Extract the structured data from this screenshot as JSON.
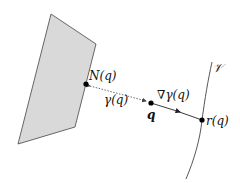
{
  "diagram": {
    "colors": {
      "polygon_fill": "#d9d9d9",
      "stroke": "#444444",
      "point": "#000000",
      "background": "#ffffff"
    },
    "labels": {
      "manifold": "𝒱",
      "projection_point": "N(q)",
      "distance": "γ(q)",
      "query_point": "q",
      "gradient": "∇γ(q)",
      "reflected_point": "r(q)"
    },
    "points": {
      "N_q": [
        86,
        84
      ],
      "q": [
        151,
        103
      ],
      "r_q": [
        202,
        120
      ]
    }
  }
}
